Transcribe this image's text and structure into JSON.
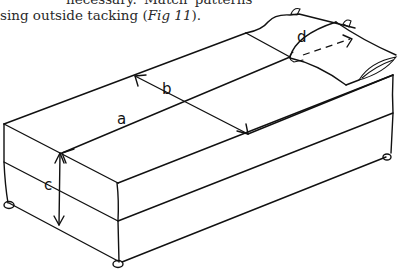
{
  "text": {
    "line1": "necessary.  Match  patterns",
    "line2_prefix": "sing outside tacking (",
    "line2_ref": "Fig 11",
    "line2_suffix": ")."
  },
  "figure": {
    "labels": {
      "a": "a",
      "b": "b",
      "c": "c",
      "d": "d"
    }
  }
}
